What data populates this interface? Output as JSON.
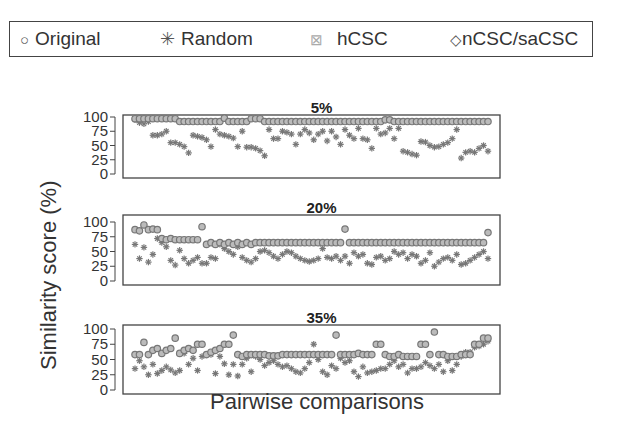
{
  "legend": {
    "items": [
      {
        "symbol": "○",
        "label": "Original"
      },
      {
        "symbol": "✳",
        "label": "Random"
      },
      {
        "symbol": "⊠",
        "label": "hCSC"
      },
      {
        "symbol": "◇",
        "label": "nCSC/saCSC"
      }
    ]
  },
  "ylabel": "Similarity score (%)",
  "xlabel": "Pairwise comparisons",
  "chart_data": [
    {
      "type": "scatter",
      "title": "5%",
      "xlabel": "Pairwise comparisons",
      "ylabel": "Similarity score (%)",
      "ylim": [
        0,
        100
      ],
      "yticks": [
        0,
        25,
        50,
        75,
        100
      ],
      "series": [
        {
          "name": "nCSC/saCSC",
          "values": [
            97,
            97,
            97,
            97,
            97,
            97,
            97,
            97,
            97,
            97,
            92,
            92,
            92,
            92,
            92,
            92,
            92,
            92,
            92,
            92,
            98,
            92,
            92,
            92,
            92,
            92,
            97,
            97,
            97,
            92,
            92,
            92,
            92,
            92,
            92,
            92,
            92,
            92,
            92,
            92,
            92,
            92,
            92,
            92,
            92,
            92,
            92,
            92,
            92,
            92,
            92,
            92,
            92,
            92,
            92,
            92,
            95,
            95,
            92,
            92,
            92,
            92,
            92,
            92,
            92,
            92,
            92,
            92,
            92,
            92,
            92,
            92,
            92,
            92,
            92,
            92,
            92,
            92,
            92,
            92
          ]
        },
        {
          "name": "Random",
          "values": [
            95,
            90,
            88,
            92,
            68,
            68,
            70,
            75,
            55,
            55,
            52,
            48,
            37,
            68,
            66,
            64,
            60,
            48,
            78,
            70,
            68,
            66,
            63,
            48,
            75,
            47,
            47,
            45,
            41,
            32,
            78,
            62,
            62,
            75,
            73,
            70,
            52,
            70,
            78,
            72,
            60,
            70,
            75,
            58,
            75,
            65,
            52,
            78,
            68,
            62,
            80,
            62,
            60,
            45,
            80,
            70,
            72,
            80,
            62,
            80,
            40,
            38,
            35,
            33,
            57,
            56,
            50,
            47,
            48,
            52,
            55,
            62,
            78,
            28,
            38,
            40,
            38,
            45,
            50,
            40
          ]
        }
      ]
    },
    {
      "type": "scatter",
      "title": "20%",
      "xlabel": "Pairwise comparisons",
      "ylabel": "Similarity score (%)",
      "ylim": [
        0,
        100
      ],
      "yticks": [
        0,
        25,
        50,
        75,
        100
      ],
      "series": [
        {
          "name": "nCSC/saCSC",
          "values": [
            87,
            85,
            95,
            87,
            88,
            87,
            72,
            70,
            72,
            70,
            70,
            70,
            70,
            70,
            70,
            92,
            62,
            65,
            62,
            65,
            62,
            65,
            62,
            65,
            62,
            65,
            62,
            65,
            65,
            65,
            65,
            65,
            65,
            65,
            65,
            65,
            65,
            65,
            65,
            65,
            65,
            65,
            65,
            65,
            65,
            65,
            65,
            88,
            65,
            65,
            65,
            65,
            65,
            65,
            65,
            65,
            65,
            65,
            65,
            65,
            65,
            65,
            65,
            65,
            65,
            65,
            65,
            65,
            65,
            65,
            65,
            65,
            65,
            65,
            65,
            65,
            65,
            65,
            65,
            82
          ]
        },
        {
          "name": "Random",
          "values": [
            62,
            38,
            57,
            32,
            45,
            72,
            65,
            58,
            35,
            27,
            52,
            38,
            30,
            35,
            40,
            30,
            30,
            40,
            38,
            62,
            55,
            50,
            45,
            58,
            40,
            35,
            32,
            38,
            50,
            52,
            48,
            42,
            38,
            45,
            50,
            48,
            42,
            38,
            35,
            33,
            35,
            38,
            55,
            40,
            38,
            42,
            35,
            42,
            30,
            48,
            42,
            45,
            30,
            28,
            40,
            42,
            35,
            38,
            50,
            45,
            48,
            38,
            45,
            42,
            30,
            35,
            48,
            25,
            32,
            38,
            40,
            35,
            45,
            28,
            30,
            35,
            40,
            45,
            50,
            38
          ]
        }
      ]
    },
    {
      "type": "scatter",
      "title": "35%",
      "xlabel": "Pairwise comparisons",
      "ylabel": "Similarity score (%)",
      "ylim": [
        0,
        100
      ],
      "yticks": [
        0,
        25,
        50,
        75,
        100
      ],
      "series": [
        {
          "name": "nCSC/saCSC",
          "values": [
            58,
            58,
            78,
            58,
            65,
            68,
            60,
            65,
            68,
            85,
            60,
            65,
            68,
            65,
            75,
            75,
            58,
            62,
            65,
            68,
            75,
            75,
            90,
            58,
            55,
            58,
            58,
            58,
            58,
            58,
            56,
            56,
            56,
            58,
            58,
            58,
            58,
            58,
            58,
            58,
            58,
            58,
            58,
            58,
            58,
            90,
            58,
            58,
            58,
            58,
            60,
            58,
            58,
            58,
            75,
            75,
            58,
            55,
            55,
            58,
            55,
            55,
            55,
            55,
            75,
            75,
            58,
            95,
            58,
            58,
            55,
            55,
            55,
            58,
            58,
            58,
            75,
            75,
            85,
            85
          ]
        },
        {
          "name": "Random",
          "values": [
            35,
            48,
            38,
            25,
            42,
            27,
            32,
            38,
            33,
            28,
            32,
            60,
            42,
            52,
            32,
            55,
            58,
            58,
            27,
            55,
            43,
            25,
            42,
            23,
            42,
            52,
            30,
            55,
            50,
            40,
            45,
            48,
            42,
            38,
            40,
            35,
            30,
            28,
            35,
            45,
            75,
            50,
            30,
            25,
            40,
            35,
            52,
            45,
            48,
            30,
            22,
            38,
            28,
            30,
            32,
            35,
            35,
            42,
            48,
            38,
            42,
            28,
            35,
            35,
            38,
            45,
            40,
            35,
            42,
            30,
            48,
            32,
            42,
            55,
            62,
            62,
            70,
            72,
            75,
            80
          ]
        }
      ]
    }
  ]
}
